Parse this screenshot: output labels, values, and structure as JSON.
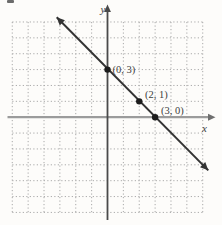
{
  "figure": {
    "background": "#fdfcfa",
    "grid_color": "#a9a9a9",
    "x_axis_color": "#9b9b9b",
    "x_arrow_color": "#6f6f6f",
    "y_axis_color": "#4a4a4a",
    "line_color": "#333333",
    "point_color": "#1c1c1c",
    "label_color": "#3c3c3c"
  },
  "chart_data": {
    "type": "line",
    "xlabel": "x",
    "ylabel": "y",
    "xlim": [
      -6,
      6
    ],
    "ylim": [
      -6,
      6
    ],
    "grid": "dotted",
    "grid_step": 1,
    "line_equation": "y = -x + 3",
    "line_segment": {
      "from": [
        -3.2,
        6.3
      ],
      "to": [
        6.35,
        -3.35
      ],
      "arrows": "both"
    },
    "labeled_points": [
      {
        "x": 0,
        "y": 3,
        "label": "(0, 3)"
      },
      {
        "x": 2,
        "y": 1,
        "label": "(2, 1)"
      },
      {
        "x": 3,
        "y": 0,
        "label": "(3, 0)"
      }
    ]
  }
}
